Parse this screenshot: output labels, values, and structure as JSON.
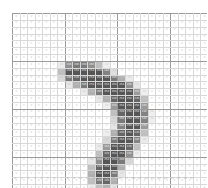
{
  "figure": {
    "kind": "pixel-value-grid",
    "rows": 28,
    "cols": 28,
    "value_min": 0,
    "value_max": 255,
    "major_gridline_every": 7,
    "colors": {
      "background": "#ffffff",
      "minor_gridline": "#d8d8d8",
      "major_gridline": "#9a9a9a",
      "zero_cell": "#ffffff",
      "max_cell": "#555555",
      "light_text": "#c8c8c8",
      "dark_text": "#f0f0f0",
      "tick_text": "#b4b4b4"
    }
  },
  "ticks": {
    "bottom": [
      "0",
      "1",
      "2",
      "3",
      "4",
      "5",
      "6",
      "7",
      "8",
      "9",
      "10",
      "11",
      "12",
      "13",
      "14",
      "15",
      "16",
      "17",
      "18",
      "19",
      "20",
      "21",
      "22",
      "23",
      "24",
      "25",
      "26",
      "27"
    ]
  },
  "chart_data": {
    "type": "heatmap",
    "title": "",
    "xlabel": "",
    "ylabel": "",
    "xlim": [
      0,
      27
    ],
    "ylim": [
      0,
      27
    ],
    "grid": true,
    "legend": "none",
    "colormap": "gray_r",
    "vmin": 0,
    "vmax": 255,
    "cell_labels": true,
    "categories_x": [
      "0",
      "1",
      "2",
      "3",
      "4",
      "5",
      "6",
      "7",
      "8",
      "9",
      "10",
      "11",
      "12",
      "13",
      "14",
      "15",
      "16",
      "17",
      "18",
      "19",
      "20",
      "21",
      "22",
      "23",
      "24",
      "25",
      "26",
      "27"
    ],
    "categories_y": [
      "0",
      "1",
      "2",
      "3",
      "4",
      "5",
      "6",
      "7",
      "8",
      "9",
      "10",
      "11",
      "12",
      "13",
      "14",
      "15",
      "16",
      "17",
      "18",
      "19",
      "20",
      "21",
      "22",
      "23",
      "24",
      "25",
      "26",
      "27"
    ],
    "values": [
      [
        0,
        0,
        0,
        0,
        0,
        0,
        0,
        0,
        0,
        0,
        0,
        0,
        0,
        0,
        0,
        0,
        0,
        0,
        0,
        0,
        0,
        0,
        0,
        0,
        0,
        0,
        0,
        0
      ],
      [
        0,
        0,
        0,
        0,
        0,
        0,
        0,
        0,
        0,
        0,
        0,
        0,
        0,
        0,
        0,
        0,
        0,
        0,
        0,
        0,
        0,
        0,
        0,
        0,
        0,
        0,
        0,
        0
      ],
      [
        0,
        0,
        0,
        0,
        0,
        0,
        0,
        0,
        0,
        0,
        0,
        0,
        0,
        0,
        0,
        0,
        0,
        0,
        0,
        0,
        0,
        0,
        0,
        0,
        0,
        0,
        0,
        0
      ],
      [
        0,
        0,
        0,
        0,
        0,
        0,
        0,
        0,
        0,
        0,
        0,
        0,
        0,
        0,
        0,
        0,
        0,
        0,
        0,
        0,
        0,
        0,
        0,
        0,
        0,
        0,
        0,
        0
      ],
      [
        0,
        0,
        0,
        0,
        0,
        0,
        0,
        0,
        0,
        0,
        0,
        0,
        0,
        0,
        0,
        0,
        0,
        0,
        0,
        0,
        0,
        0,
        0,
        0,
        0,
        0,
        0,
        0
      ],
      [
        0,
        0,
        0,
        0,
        0,
        0,
        0,
        0,
        0,
        0,
        0,
        0,
        0,
        0,
        0,
        0,
        0,
        0,
        0,
        0,
        0,
        0,
        0,
        0,
        0,
        0,
        0,
        0
      ],
      [
        0,
        0,
        0,
        0,
        0,
        0,
        0,
        0,
        0,
        0,
        0,
        0,
        0,
        0,
        0,
        0,
        0,
        0,
        0,
        0,
        0,
        0,
        0,
        0,
        0,
        0,
        0,
        0
      ],
      [
        0,
        0,
        0,
        0,
        0,
        0,
        30,
        166,
        200,
        200,
        166,
        96,
        24,
        0,
        0,
        0,
        0,
        0,
        0,
        0,
        0,
        0,
        0,
        0,
        0,
        0,
        0,
        0
      ],
      [
        0,
        0,
        0,
        0,
        0,
        0,
        96,
        254,
        254,
        254,
        254,
        254,
        186,
        48,
        0,
        0,
        0,
        0,
        0,
        0,
        0,
        0,
        0,
        0,
        0,
        0,
        0,
        0
      ],
      [
        0,
        0,
        0,
        0,
        0,
        0,
        60,
        200,
        230,
        254,
        254,
        254,
        254,
        200,
        120,
        30,
        0,
        0,
        0,
        0,
        0,
        0,
        0,
        0,
        0,
        0,
        0,
        0
      ],
      [
        0,
        0,
        0,
        0,
        0,
        0,
        0,
        36,
        120,
        200,
        254,
        254,
        254,
        254,
        254,
        166,
        36,
        0,
        0,
        0,
        0,
        0,
        0,
        0,
        0,
        0,
        0,
        0
      ],
      [
        0,
        0,
        0,
        0,
        0,
        0,
        0,
        0,
        0,
        30,
        120,
        200,
        254,
        254,
        254,
        254,
        150,
        24,
        0,
        0,
        0,
        0,
        0,
        0,
        0,
        0,
        0,
        0
      ],
      [
        0,
        0,
        0,
        0,
        0,
        0,
        0,
        0,
        0,
        0,
        0,
        36,
        120,
        230,
        254,
        254,
        230,
        96,
        0,
        0,
        0,
        0,
        0,
        0,
        0,
        0,
        0,
        0
      ],
      [
        0,
        0,
        0,
        0,
        0,
        0,
        0,
        0,
        0,
        0,
        0,
        0,
        24,
        150,
        254,
        254,
        254,
        150,
        0,
        0,
        0,
        0,
        0,
        0,
        0,
        0,
        0,
        0
      ],
      [
        0,
        0,
        0,
        0,
        0,
        0,
        0,
        0,
        0,
        0,
        0,
        0,
        0,
        96,
        230,
        254,
        254,
        186,
        24,
        0,
        0,
        0,
        0,
        0,
        0,
        0,
        0,
        0
      ],
      [
        0,
        0,
        0,
        0,
        0,
        0,
        0,
        0,
        0,
        0,
        0,
        0,
        0,
        60,
        200,
        254,
        254,
        186,
        24,
        0,
        0,
        0,
        0,
        0,
        0,
        0,
        0,
        0
      ],
      [
        0,
        0,
        0,
        0,
        0,
        0,
        0,
        0,
        0,
        0,
        0,
        0,
        0,
        36,
        186,
        254,
        254,
        150,
        0,
        0,
        0,
        0,
        0,
        0,
        0,
        0,
        0,
        0
      ],
      [
        0,
        0,
        0,
        0,
        0,
        0,
        0,
        0,
        0,
        0,
        0,
        0,
        24,
        120,
        230,
        254,
        230,
        96,
        0,
        0,
        0,
        0,
        0,
        0,
        0,
        0,
        0,
        0
      ],
      [
        0,
        0,
        0,
        0,
        0,
        0,
        0,
        0,
        0,
        0,
        0,
        0,
        60,
        200,
        254,
        254,
        186,
        30,
        0,
        0,
        0,
        0,
        0,
        0,
        0,
        0,
        0,
        0
      ],
      [
        0,
        0,
        0,
        0,
        0,
        0,
        0,
        0,
        0,
        0,
        0,
        30,
        150,
        254,
        254,
        230,
        96,
        0,
        0,
        0,
        0,
        0,
        0,
        0,
        0,
        0,
        0,
        0
      ],
      [
        0,
        0,
        0,
        0,
        0,
        0,
        0,
        0,
        0,
        0,
        0,
        96,
        230,
        254,
        254,
        166,
        24,
        0,
        0,
        0,
        0,
        0,
        0,
        0,
        0,
        0,
        0,
        0
      ],
      [
        0,
        0,
        0,
        0,
        0,
        0,
        0,
        0,
        0,
        0,
        36,
        166,
        254,
        254,
        200,
        60,
        0,
        0,
        0,
        0,
        0,
        0,
        0,
        0,
        0,
        0,
        0,
        0
      ],
      [
        0,
        0,
        0,
        0,
        0,
        0,
        0,
        0,
        0,
        0,
        96,
        230,
        254,
        254,
        120,
        0,
        0,
        0,
        0,
        0,
        0,
        0,
        0,
        0,
        0,
        0,
        0,
        0
      ],
      [
        0,
        0,
        0,
        0,
        0,
        0,
        0,
        0,
        0,
        0,
        120,
        254,
        254,
        200,
        36,
        0,
        0,
        0,
        0,
        0,
        0,
        0,
        0,
        0,
        0,
        0,
        0,
        0
      ],
      [
        0,
        0,
        0,
        0,
        0,
        0,
        0,
        0,
        0,
        0,
        96,
        200,
        230,
        120,
        0,
        0,
        0,
        0,
        0,
        0,
        0,
        0,
        0,
        0,
        0,
        0,
        0,
        0
      ],
      [
        0,
        0,
        0,
        0,
        0,
        0,
        0,
        0,
        0,
        0,
        24,
        96,
        120,
        36,
        0,
        0,
        0,
        0,
        0,
        0,
        0,
        0,
        0,
        0,
        0,
        0,
        0,
        0
      ],
      [
        0,
        0,
        0,
        0,
        0,
        0,
        0,
        0,
        0,
        0,
        0,
        0,
        0,
        0,
        0,
        0,
        0,
        0,
        0,
        0,
        0,
        0,
        0,
        0,
        0,
        0,
        0,
        0
      ],
      [
        0,
        0,
        0,
        0,
        0,
        0,
        0,
        0,
        0,
        0,
        0,
        0,
        0,
        0,
        0,
        0,
        0,
        0,
        0,
        0,
        0,
        0,
        0,
        0,
        0,
        0,
        0,
        0
      ]
    ]
  }
}
